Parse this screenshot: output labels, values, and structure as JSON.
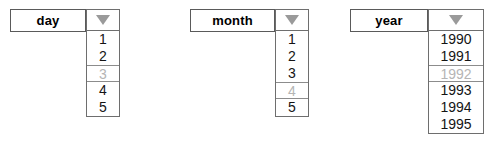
{
  "widgets": [
    {
      "id": "day",
      "label": "day",
      "arrow_icon": "triangle-down-icon",
      "items": [
        {
          "text": "1",
          "disabled": false
        },
        {
          "text": "2",
          "disabled": false
        },
        {
          "text": "3",
          "disabled": true
        },
        {
          "text": "4",
          "disabled": false
        },
        {
          "text": "5",
          "disabled": false
        }
      ]
    },
    {
      "id": "month",
      "label": "month",
      "arrow_icon": "triangle-down-icon",
      "items": [
        {
          "text": "1",
          "disabled": false
        },
        {
          "text": "2",
          "disabled": false
        },
        {
          "text": "3",
          "disabled": false
        },
        {
          "text": "4",
          "disabled": true
        },
        {
          "text": "5",
          "disabled": false
        }
      ]
    },
    {
      "id": "year",
      "label": "year",
      "arrow_icon": "triangle-down-icon",
      "items": [
        {
          "text": "1990",
          "disabled": false
        },
        {
          "text": "1991",
          "disabled": false
        },
        {
          "text": "1992",
          "disabled": true
        },
        {
          "text": "1993",
          "disabled": false
        },
        {
          "text": "1994",
          "disabled": false
        },
        {
          "text": "1995",
          "disabled": false
        }
      ]
    }
  ],
  "colors": {
    "text": "#141414",
    "disabled_text": "#b5b5b5",
    "border": "#6e6e6e",
    "label_border": "#5a5a5a",
    "arrow_fill": "#9a9a9a",
    "background": "#ffffff"
  }
}
